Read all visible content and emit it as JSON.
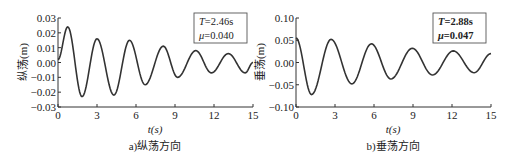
{
  "chart_data": [
    {
      "type": "line",
      "title": "",
      "caption": "a)纵荡方向",
      "xlabel": "t(s)",
      "ylabel": "纵荡(m)",
      "xlim": [
        0,
        15
      ],
      "ylim": [
        -0.03,
        0.03
      ],
      "xticks": [
        0,
        3,
        6,
        9,
        12,
        15
      ],
      "xtick_labels": [
        "0",
        "3",
        "6",
        "9",
        "12",
        "15"
      ],
      "yticks": [
        -0.03,
        -0.02,
        -0.01,
        0.0,
        0.01,
        0.02,
        0.03
      ],
      "ytick_labels": [
        "-0.03",
        "-0.02",
        "-0.01",
        "0.00",
        "0.01",
        "0.02",
        "0.03"
      ],
      "grid": false,
      "annotation": {
        "line1_var": "T",
        "line1_val": "=2.46s",
        "line2_var": "μ",
        "line2_val": "=0.040"
      },
      "series": [
        {
          "name": "纵荡",
          "x": [
            0,
            0.75,
            1.85,
            3.0,
            4.3,
            5.5,
            6.7,
            8.1,
            9.2,
            10.6,
            11.8,
            13.1,
            14.4,
            15
          ],
          "y": [
            0.002,
            0.024,
            -0.023,
            0.016,
            -0.022,
            0.015,
            -0.015,
            0.011,
            -0.01,
            0.008,
            -0.007,
            0.006,
            -0.007,
            0.0
          ]
        }
      ]
    },
    {
      "type": "line",
      "title": "",
      "caption": "b)垂荡方向",
      "xlabel": "t(s)",
      "ylabel": "垂荡(m)",
      "xlim": [
        0,
        15
      ],
      "ylim": [
        -0.1,
        0.1
      ],
      "xticks": [
        0,
        3,
        6,
        9,
        12,
        15
      ],
      "xtick_labels": [
        "0",
        "3",
        "6",
        "9",
        "12",
        "15"
      ],
      "yticks": [
        -0.1,
        -0.05,
        0.0,
        0.05,
        0.1
      ],
      "ytick_labels": [
        "-0.10",
        "-0.05",
        "0.00",
        "0.05",
        "0.10"
      ],
      "grid": false,
      "annotation": {
        "line1_var": "T",
        "line1_val": "=2.88s",
        "line2_var": "μ",
        "line2_val": "=0.047"
      },
      "series": [
        {
          "name": "垂荡",
          "x": [
            0,
            1.2,
            2.7,
            4.3,
            5.8,
            7.3,
            8.95,
            10.5,
            12.1,
            13.7,
            15
          ],
          "y": [
            0.055,
            -0.072,
            0.052,
            -0.048,
            0.042,
            -0.037,
            0.032,
            -0.028,
            0.026,
            -0.023,
            0.02
          ]
        }
      ]
    }
  ]
}
